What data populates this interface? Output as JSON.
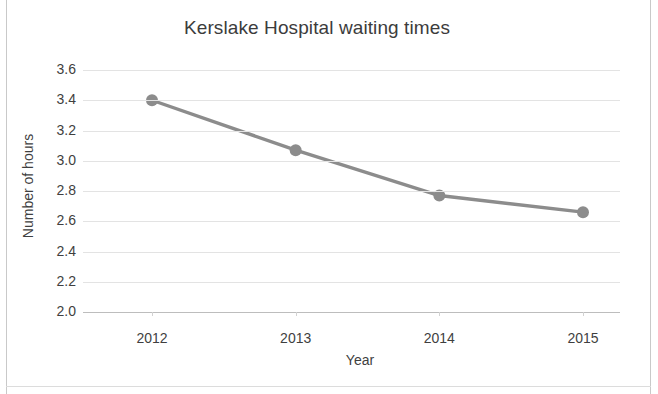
{
  "chart_data": {
    "type": "line",
    "title": "Kerslake Hospital waiting times",
    "xlabel": "Year",
    "ylabel": "Number of hours",
    "categories": [
      "2012",
      "2013",
      "2014",
      "2015"
    ],
    "values": [
      3.4,
      3.07,
      2.77,
      2.66
    ],
    "series": [
      {
        "name": "waiting time",
        "values": [
          3.4,
          3.07,
          2.77,
          2.66
        ]
      }
    ],
    "ylim": [
      2.0,
      3.6
    ],
    "ytick_labels": [
      "3.6",
      "3.4",
      "3.2",
      "3.0",
      "2.8",
      "2.6",
      "2.4",
      "2.2",
      "2.0"
    ],
    "ytick_values": [
      3.6,
      3.4,
      3.2,
      3.0,
      2.8,
      2.6,
      2.4,
      2.2,
      2.0
    ],
    "ystep": 0.2,
    "grid": true,
    "legend": "none",
    "marker": "circle",
    "line_color": "#8c8c8c",
    "marker_color": "#8c8c8c",
    "grid_color": "#e3e3e3",
    "text_color": "#3f3f3f",
    "background": "#ffffff"
  },
  "axes": {
    "y_title": "Number of hours",
    "x_title": "Year"
  },
  "title": {
    "text": "Kerslake Hospital waiting times"
  }
}
